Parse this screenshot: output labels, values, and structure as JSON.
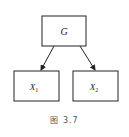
{
  "diagram": {
    "nodes": [
      {
        "id": "G",
        "label": "G",
        "sub": ""
      },
      {
        "id": "X1",
        "label": "X",
        "sub": "1"
      },
      {
        "id": "X2",
        "label": "X",
        "sub": "2"
      }
    ],
    "edges": [
      {
        "from": "G",
        "to": "X1"
      },
      {
        "from": "G",
        "to": "X2"
      }
    ],
    "caption": "图 3.7",
    "colors": {
      "stroke": "#222222",
      "background": "#ffffff"
    }
  }
}
